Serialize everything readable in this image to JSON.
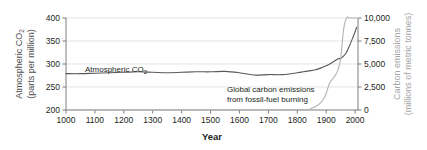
{
  "chart_data": {
    "type": "line",
    "title": "",
    "xlabel": "Year",
    "ylabel": "Atmospheric CO2 (parts per million)",
    "y2label": "Carbon emissions (millions of metric tonnes)",
    "grid": true,
    "legend": "annotations-inline",
    "xlim": [
      1000,
      2010
    ],
    "ylim": [
      200,
      400
    ],
    "y2lim": [
      0,
      10000
    ],
    "xticks": [
      1000,
      1100,
      1200,
      1300,
      1400,
      1500,
      1600,
      1700,
      1800,
      1900,
      2000
    ],
    "xtick_labels": [
      "1000",
      "1100",
      "1200",
      "1300",
      "1400",
      "1500",
      "1600",
      "1700",
      "1800",
      "1900",
      "2000"
    ],
    "yticks": [
      200,
      250,
      300,
      350,
      400
    ],
    "ytick_labels": [
      "200",
      "250",
      "300",
      "350",
      "400"
    ],
    "y2ticks": [
      0,
      2500,
      5000,
      7500,
      10000
    ],
    "y2tick_labels": [
      "0",
      "2,500",
      "5,000",
      "7,500",
      "10,000"
    ],
    "axis_label_left_line1": "Atmospheric CO",
    "axis_label_left_sub": "2",
    "axis_label_left_line2": "(parts per million)",
    "axis_label_right_line1": "Carbon emissions",
    "axis_label_right_line2": "(millions of metric tonnes)",
    "annotations": [
      {
        "name": "co2-series-label",
        "text_line1": "Atmospheric CO",
        "sub": "2",
        "text_line2": "",
        "x": 85,
        "y": 72,
        "color": "#231f20"
      },
      {
        "name": "emissions-series-label",
        "text_line1": "Global carbon emissions",
        "sub": "",
        "text_line2": "from fossil-fuel burning",
        "x": 227,
        "y": 92,
        "color": "#231f20"
      }
    ],
    "series": [
      {
        "name": "Atmospheric CO2",
        "axis": "left",
        "units": "parts per million",
        "color": "#58595b",
        "x": [
          1000,
          1050,
          1100,
          1150,
          1200,
          1250,
          1300,
          1350,
          1400,
          1450,
          1500,
          1550,
          1600,
          1650,
          1700,
          1750,
          1800,
          1820,
          1840,
          1860,
          1880,
          1900,
          1920,
          1940,
          1950,
          1960,
          1970,
          1980,
          1990,
          2000,
          2005
        ],
        "values": [
          279,
          279,
          280,
          281,
          282,
          283,
          282,
          281,
          282,
          283,
          283,
          284,
          281,
          276,
          277,
          277,
          281,
          283,
          285,
          287,
          291,
          296,
          303,
          311,
          312,
          317,
          325,
          339,
          354,
          370,
          380
        ]
      },
      {
        "name": "Global carbon emissions from fossil-fuel burning",
        "axis": "right",
        "units": "millions of metric tonnes",
        "color": "#b3b3b3",
        "x": [
          1000,
          1200,
          1400,
          1600,
          1700,
          1750,
          1800,
          1820,
          1840,
          1850,
          1860,
          1870,
          1880,
          1890,
          1900,
          1910,
          1920,
          1930,
          1940,
          1950,
          1960,
          1970,
          1980,
          1990,
          2000,
          2005
        ],
        "values": [
          0,
          0,
          0,
          0,
          0,
          0,
          30,
          40,
          60,
          200,
          330,
          520,
          780,
          1150,
          1800,
          2800,
          3300,
          3700,
          4300,
          5600,
          8700,
          14300,
          18500,
          22000,
          24000,
          28000
        ]
      }
    ]
  }
}
